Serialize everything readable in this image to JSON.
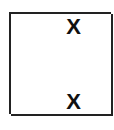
{
  "board": {
    "rows": 4,
    "cols": 4,
    "cells": [
      [
        "",
        "",
        "X",
        ""
      ],
      [
        "",
        "",
        "",
        ""
      ],
      [
        "",
        "",
        "",
        ""
      ],
      [
        "",
        "",
        "X",
        ""
      ]
    ]
  },
  "colors": {
    "line": "#222222",
    "mark": "#111111",
    "background": "#ffffff"
  }
}
